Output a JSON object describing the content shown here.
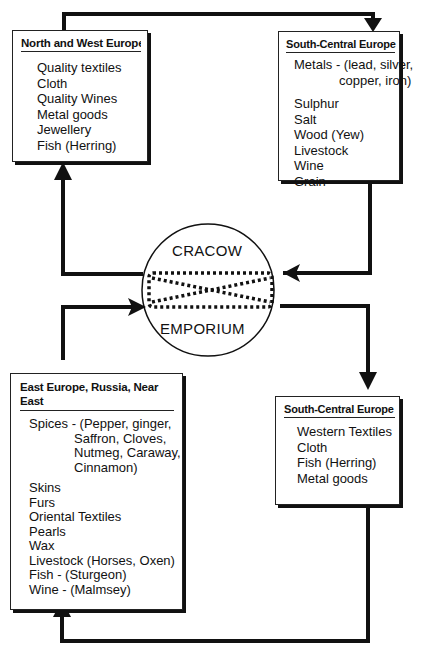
{
  "center": {
    "top": "CRACOW",
    "bottom": "EMPORIUM"
  },
  "boxes": {
    "nw": {
      "title": "North and West Europe",
      "items": [
        "Quality textiles",
        "Cloth",
        "Quality Wines",
        "Metal goods",
        "Jewellery",
        "Fish (Herring)"
      ]
    },
    "sc1": {
      "title": "South-Central Europe",
      "items": [
        "Metals - (lead, silver,",
        "copper, iron)",
        "Sulphur",
        "Salt",
        "Wood (Yew)",
        "Livestock",
        "Wine",
        "Grain"
      ]
    },
    "east": {
      "title_line1": "East Europe, Russia, Near",
      "title_line2": "East",
      "items": [
        "Spices - (Pepper, ginger,",
        "Saffron, Cloves,",
        "Nutmeg, Caraway,",
        "Cinnamon)",
        "Skins",
        "Furs",
        "Oriental Textiles",
        "Pearls",
        "Wax",
        "Livestock (Horses, Oxen)",
        "Fish - (Sturgeon)",
        "Wine - (Malmsey)"
      ]
    },
    "sc2": {
      "title": "South-Central Europe",
      "items": [
        "Western Textiles",
        "Cloth",
        "Fish (Herring)",
        "Metal goods"
      ]
    }
  }
}
